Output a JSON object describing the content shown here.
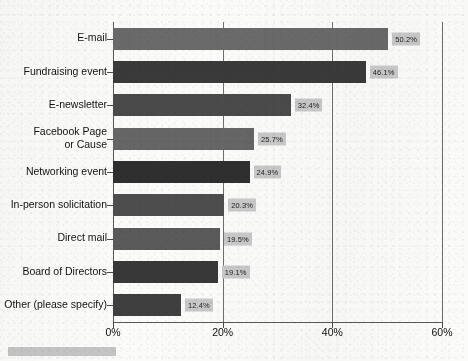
{
  "chart_data": {
    "type": "bar",
    "orientation": "horizontal",
    "title": "",
    "subtitle": "",
    "xlabel": "",
    "ylabel": "",
    "xlim": [
      0,
      60
    ],
    "grid": true,
    "gridlines_vertical": true,
    "legend": "none",
    "xticks": [
      "0%",
      "20%",
      "40%",
      "60%"
    ],
    "xtick_values": [
      0,
      20,
      40,
      60
    ],
    "categories": [
      "E-mail",
      "Fundraising event",
      "E-newsletter",
      "Facebook Page\nor Cause",
      "Networking event",
      "In-person solicitation",
      "Direct mail",
      "Board of Directors",
      "Other (please specify)"
    ],
    "values": [
      50.2,
      46.1,
      32.4,
      25.7,
      24.9,
      20.3,
      19.5,
      19.1,
      12.4
    ],
    "value_labels": [
      "50.2%",
      "46.1%",
      "32.4%",
      "25.7%",
      "24.9%",
      "20.3%",
      "19.5%",
      "19.1%",
      "12.4%"
    ],
    "bar_colors": [
      "#6a6a6a",
      "#3a3a3a",
      "#4a4a4a",
      "#666666",
      "#2f2f2f",
      "#4e4e4e",
      "#5a5a5a",
      "#383838",
      "#3f3f3f"
    ],
    "value_label_background": "#c9c9c9",
    "axis_color": "#5b5b5b",
    "background": "#fbfbfa"
  }
}
